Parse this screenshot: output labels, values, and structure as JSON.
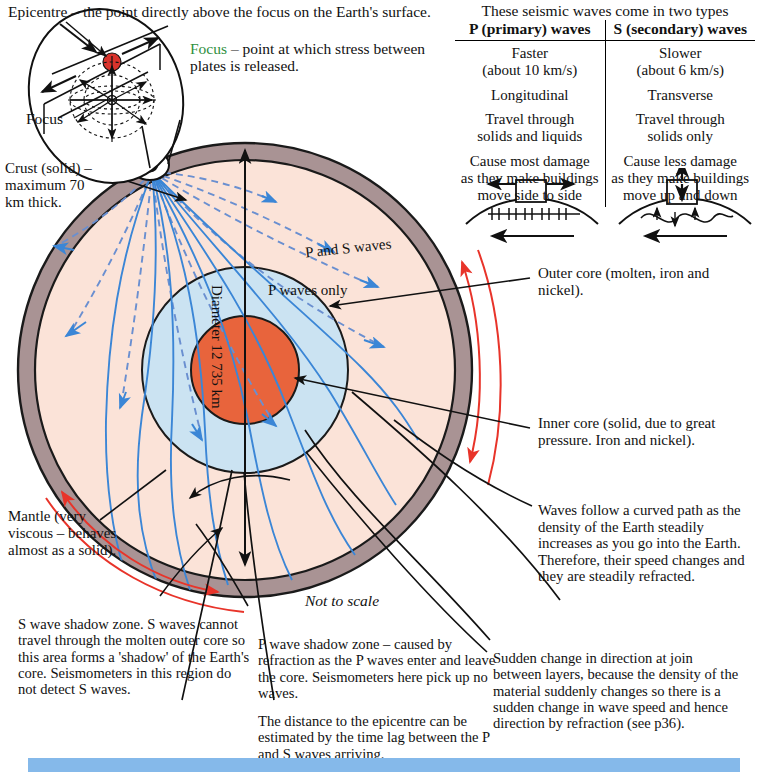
{
  "captions": {
    "epicentre": "Epicentre – the point directly above the focus on the Earth's surface.",
    "focus_lead": "Focus",
    "focus_rest": " – point at which stress between plates is released.",
    "focus_inset": "Focus",
    "crust": "Crust (solid) – maximum 70 km thick.",
    "mantle": "Mantle (very viscous – behaves almost as a solid).",
    "outer_core": "Outer core (molten, iron and nickel).",
    "inner_core": "Inner core (solid, due to great pressure. Iron and nickel).",
    "curved_path": "Waves follow a curved path as the density of the Earth steadily increases as you go into the Earth. Therefore, their speed changes and they are steadily refracted.",
    "sudden_change": "Sudden change in direction at join between layers, because the density of the material suddenly changes so there is a sudden change in wave speed and hence direction by refraction (see p36).",
    "s_shadow": "S wave shadow zone. S waves cannot travel through the molten outer core so this area forms a 'shadow' of the Earth's core. Seismometers in this region do not detect S waves.",
    "p_shadow": "P wave shadow zone – caused by refraction as the P waves enter and leave the core. Seismometers here pick up no waves.",
    "time_lag": "The distance to the epicentre can be estimated by the time lag between the P and S waves arriving.",
    "not_to_scale": "Not to scale"
  },
  "diagram_labels": {
    "p_and_s_waves": "P and S waves",
    "p_waves_only": "P waves only",
    "diameter": "Diameter 12 735 km"
  },
  "wave_table": {
    "title": "These seismic waves come in two types",
    "headers": [
      "P (primary) waves",
      "S (secondary) waves"
    ],
    "rows": [
      [
        "Faster\n(about 10 km/s)",
        "Slower\n(about 6 km/s)"
      ],
      [
        "Longitudinal",
        "Transverse"
      ],
      [
        "Travel through\nsolids and liquids",
        "Travel through\nsolids only"
      ],
      [
        "Cause most damage\nas they make buildings\nmove side to side",
        "Cause less damage\nas they make buildings\nmove up and down"
      ]
    ]
  },
  "colors": {
    "crust": "#a99394",
    "mantle": "#fbe3d8",
    "outer_core": "#cbe3f2",
    "inner_core": "#e8643c",
    "p_s_wave": "#3b86d6",
    "s_shadow_marker": "#e8342a",
    "epicentre_dot": "#d9332c",
    "bottom_bar": "#85b9ea",
    "focus_word": "#2f8f3e"
  }
}
